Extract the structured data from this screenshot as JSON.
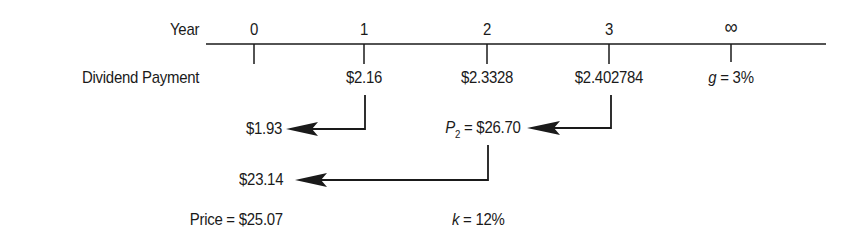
{
  "timeline": {
    "axis_label": "Year",
    "ticks": [
      {
        "label": "0",
        "dividend": ""
      },
      {
        "label": "1",
        "dividend": "$2.16"
      },
      {
        "label": "2",
        "dividend": "$2.3328"
      },
      {
        "label": "3",
        "dividend": "$2.402784"
      },
      {
        "label": "∞",
        "dividend": ""
      }
    ],
    "row_label": "Dividend Payment",
    "growth": {
      "var": "g",
      "eq": " = 3%"
    }
  },
  "calculations": {
    "pv_year1": "$1.93",
    "p2": {
      "var": "P",
      "sub": "2",
      "eq": " = $26.70"
    },
    "pv_p2": "$23.14",
    "price": "Price = $25.07",
    "discount_rate": {
      "var": "k",
      "eq": " = 12%"
    }
  }
}
